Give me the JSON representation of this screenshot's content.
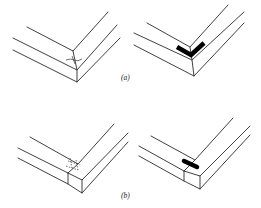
{
  "figure": {
    "panels": [
      {
        "id": "a",
        "label": "(a)",
        "description": "Mitered corner joint: plain (left) and with reinforcing V-shaped spline/fastener (right)"
      },
      {
        "id": "b",
        "label": "(b)",
        "description": "Butt corner joint: plain with dowel markings (left) and with reinforcing bar fastener (right)"
      }
    ],
    "colors": {
      "line": "#2a2a2a",
      "fill": "#000000",
      "background": "#ffffff"
    }
  }
}
